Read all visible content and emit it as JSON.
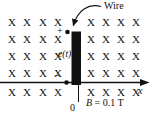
{
  "figure": {
    "field_symbol": "X",
    "wire_label": "Wire",
    "emf_label": "e(t)",
    "plus_sign": "+",
    "minus_sign": "−",
    "origin_label": "0",
    "axis_label": "x",
    "field_strength": {
      "symbol": "B",
      "value": "= 0.1 T"
    },
    "colors": {
      "ink": "#111111",
      "background": "#ffffff"
    }
  },
  "grids": {
    "rows_top": [
      17,
      34,
      51,
      68,
      87
    ],
    "left_cols": [
      8,
      23,
      39,
      54
    ],
    "right_cols": [
      87,
      102,
      117,
      132
    ]
  }
}
